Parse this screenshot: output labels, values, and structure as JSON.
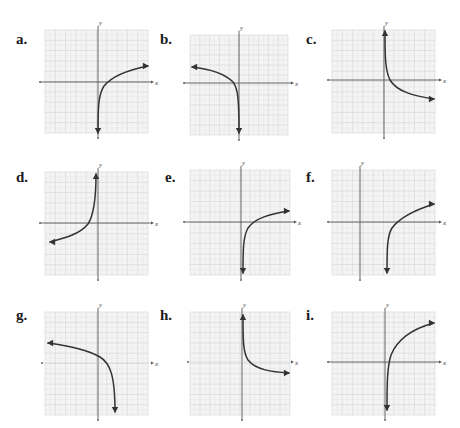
{
  "figure": {
    "panels": [
      {
        "id": "a",
        "label": "a.",
        "left": 16,
        "top": 32,
        "grid": {
          "x0": 45,
          "y0": 30,
          "x1": 148,
          "y1": 133
        },
        "axes": {
          "yaxis_x": 98,
          "xaxis_y": 82,
          "x_axis_drawn": true,
          "x_left": 40,
          "x_right": 152
        },
        "curve": "M98,133 C98,110 98,95 104,86 C112,76 128,70 148,66",
        "arrows": [
          {
            "x": 98,
            "y": 133,
            "dir": "down"
          },
          {
            "x": 148,
            "y": 66,
            "dir": "right"
          }
        ]
      },
      {
        "id": "b",
        "label": "b.",
        "left": 160,
        "top": 32,
        "grid": {
          "x0": 190,
          "y0": 35,
          "x1": 288,
          "y1": 135
        },
        "axes": {
          "yaxis_x": 239,
          "xaxis_y": 83,
          "x_axis_drawn": true,
          "x_left": 184,
          "x_right": 292
        },
        "curve": "M192,67 C210,69 225,74 233,82 C238,88 239,100 239,133",
        "arrows": [
          {
            "x": 192,
            "y": 67,
            "dir": "left"
          },
          {
            "x": 239,
            "y": 133,
            "dir": "down"
          }
        ]
      },
      {
        "id": "c",
        "label": "c.",
        "left": 306,
        "top": 32,
        "grid": {
          "x0": 332,
          "y0": 30,
          "x1": 435,
          "y1": 133
        },
        "axes": {
          "yaxis_x": 384,
          "xaxis_y": 80,
          "x_axis_drawn": true,
          "x_left": 328,
          "x_right": 440
        },
        "curve": "M385,31 C385,55 385,70 390,80 C397,92 415,96 434,99",
        "arrows": [
          {
            "x": 385,
            "y": 31,
            "dir": "up"
          },
          {
            "x": 434,
            "y": 99,
            "dir": "right"
          }
        ]
      },
      {
        "id": "d",
        "label": "d.",
        "left": 16,
        "top": 170,
        "grid": {
          "x0": 45,
          "y0": 172,
          "x1": 148,
          "y1": 275
        },
        "axes": {
          "yaxis_x": 98,
          "xaxis_y": 223,
          "x_axis_drawn": true,
          "x_left": 40,
          "x_right": 152
        },
        "curve": "M96,174 C96,200 94,215 88,224 C80,234 65,238 50,242",
        "arrows": [
          {
            "x": 96,
            "y": 174,
            "dir": "up"
          },
          {
            "x": 50,
            "y": 242,
            "dir": "left"
          }
        ]
      },
      {
        "id": "e",
        "label": "e.",
        "left": 165,
        "top": 170,
        "grid": {
          "x0": 190,
          "y0": 170,
          "x1": 290,
          "y1": 275
        },
        "axes": {
          "yaxis_x": 241,
          "xaxis_y": 222,
          "x_axis_drawn": true,
          "x_left": 184,
          "x_right": 295
        },
        "curve": "M243,273 C243,250 243,237 248,228 C255,218 270,214 289,211",
        "arrows": [
          {
            "x": 243,
            "y": 273,
            "dir": "down"
          },
          {
            "x": 289,
            "y": 211,
            "dir": "right"
          }
        ]
      },
      {
        "id": "f",
        "label": "f.",
        "left": 306,
        "top": 170,
        "grid": {
          "x0": 332,
          "y0": 170,
          "x1": 435,
          "y1": 275
        },
        "axes": {
          "yaxis_x": 360,
          "xaxis_y": 222,
          "x_axis_drawn": true,
          "x_left": 328,
          "x_right": 440
        },
        "curve": "M387,273 C387,250 387,236 392,228 C400,217 415,210 434,204",
        "arrows": [
          {
            "x": 387,
            "y": 273,
            "dir": "down"
          },
          {
            "x": 434,
            "y": 204,
            "dir": "right"
          }
        ]
      },
      {
        "id": "g",
        "label": "g.",
        "left": 16,
        "top": 308,
        "grid": {
          "x0": 45,
          "y0": 312,
          "x1": 148,
          "y1": 415
        },
        "axes": {
          "yaxis_x": 98,
          "xaxis_y": 363,
          "x_axis_drawn": false,
          "x_left": 42,
          "x_right": 152
        },
        "curve": "M48,343 C70,346 88,350 100,357 C110,363 115,375 115,412",
        "arrows": [
          {
            "x": 48,
            "y": 343,
            "dir": "left"
          },
          {
            "x": 115,
            "y": 412,
            "dir": "down"
          }
        ]
      },
      {
        "id": "h",
        "label": "h.",
        "left": 160,
        "top": 308,
        "grid": {
          "x0": 190,
          "y0": 312,
          "x1": 290,
          "y1": 415
        },
        "axes": {
          "yaxis_x": 242,
          "xaxis_y": 362,
          "x_axis_drawn": false,
          "x_left": 188,
          "x_right": 292
        },
        "curve": "M243,315 C243,340 243,352 248,360 C256,370 272,372 289,373",
        "arrows": [
          {
            "x": 243,
            "y": 315,
            "dir": "up"
          },
          {
            "x": 289,
            "y": 373,
            "dir": "right"
          }
        ]
      },
      {
        "id": "i",
        "label": "i.",
        "left": 306,
        "top": 308,
        "grid": {
          "x0": 332,
          "y0": 312,
          "x1": 435,
          "y1": 415
        },
        "axes": {
          "yaxis_x": 385,
          "xaxis_y": 362,
          "x_axis_drawn": true,
          "x_left": 328,
          "x_right": 440
        },
        "curve": "M387,410 C387,385 387,368 391,355 C398,338 415,328 434,323",
        "arrows": [
          {
            "x": 387,
            "y": 410,
            "dir": "down"
          },
          {
            "x": 434,
            "y": 323,
            "dir": "right"
          }
        ]
      }
    ],
    "axis_labels": {
      "x": "x",
      "y": "y"
    },
    "colors": {
      "grid_minor": "#e8e8e8",
      "grid_major": "#d4d4d4",
      "grid_bg": "#f4f4f4",
      "axis": "#555555",
      "curve": "#333333"
    }
  }
}
